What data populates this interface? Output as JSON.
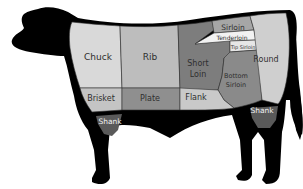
{
  "diagram": {
    "cuts": [
      {
        "id": "chuck",
        "label": "Chuck",
        "color": "#d9d9d9"
      },
      {
        "id": "rib",
        "label": "Rib",
        "color": "#bdbdbd"
      },
      {
        "id": "sirloin",
        "label": "Sirloin",
        "color": "#a6a6a6"
      },
      {
        "id": "tenderloin",
        "label": "Tenderloin",
        "color": "#f2f2f2"
      },
      {
        "id": "tip-sirloin",
        "label": "Tip Sirloin",
        "color": "#e6e6e6"
      },
      {
        "id": "short-loin",
        "label_line1": "Short",
        "label_line2": "Loin",
        "color": "#7d7d7d"
      },
      {
        "id": "bottom-sirloin",
        "label_line1": "Bottom",
        "label_line2": "Sirloin",
        "color": "#8a8a8a"
      },
      {
        "id": "round",
        "label": "Round",
        "color": "#cfcfcf"
      },
      {
        "id": "brisket",
        "label": "Brisket",
        "color": "#c4c4c4"
      },
      {
        "id": "plate",
        "label": "Plate",
        "color": "#8f8f8f"
      },
      {
        "id": "flank",
        "label": "Flank",
        "color": "#c9c9c9"
      },
      {
        "id": "front-shank",
        "label": "Shank",
        "color": "#5a5a5a"
      },
      {
        "id": "rear-shank",
        "label": "Shank",
        "color": "#5a5a5a"
      }
    ],
    "silhouette_color": "#000000"
  }
}
